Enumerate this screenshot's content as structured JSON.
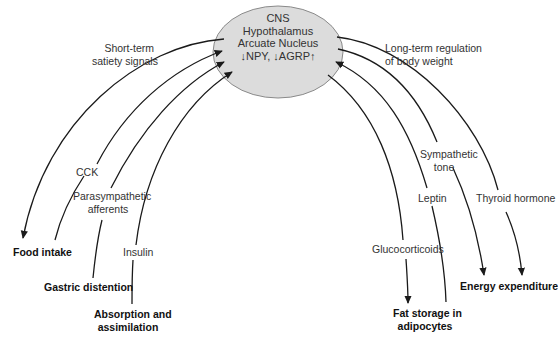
{
  "center": {
    "lines": [
      "CNS",
      "Hypothalamus",
      "Arcuate Nucleus",
      "↓NPY, ↓AGRP↑"
    ],
    "fill": "#dcdcdc",
    "stroke": "#8a8a8a"
  },
  "left": {
    "group_label": "Short-term\nsatiety signals",
    "group_label_lines": [
      "Short-term",
      "satiety signals"
    ],
    "signals": [
      "CCK",
      "Parasympathetic afferents",
      "Insulin"
    ],
    "signal_lines": {
      "cck": [
        "CCK"
      ],
      "parasympathetic": [
        "Parasympathetic",
        "afferents"
      ],
      "insulin": [
        "Insulin"
      ]
    },
    "outcomes": {
      "food_intake": [
        "Food intake"
      ],
      "gastric_distention": [
        "Gastric distention"
      ],
      "absorption": [
        "Absorption and",
        "assimilation"
      ]
    }
  },
  "right": {
    "group_label_lines": [
      "Long-term regulation",
      "of body weight"
    ],
    "signal_lines": {
      "sympathetic": [
        "Sympathetic",
        "tone"
      ],
      "leptin": [
        "Leptin"
      ],
      "thyroid": [
        "Thyroid hormone"
      ],
      "glucocorticoids": [
        "Glucocorticoids"
      ]
    },
    "outcomes": {
      "energy_expenditure": [
        "Energy expenditure"
      ],
      "fat_storage": [
        "Fat storage in",
        "adipocytes"
      ]
    }
  },
  "colors": {
    "line": "#1a1a1a",
    "text": "#333333",
    "bold_text": "#111111"
  }
}
